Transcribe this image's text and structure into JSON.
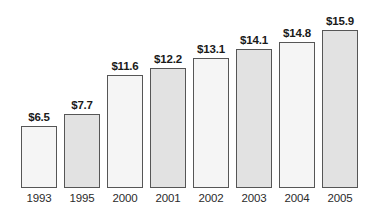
{
  "chart_data": {
    "type": "bar",
    "title": "",
    "subtitle": "",
    "xlabel": "",
    "ylabel": "",
    "grid": false,
    "legend": "none",
    "axis_visible": false,
    "value_prefix": "$",
    "ylim": [
      0,
      15.9
    ],
    "categories": [
      "1993",
      "1995",
      "2000",
      "2001",
      "2002",
      "2003",
      "2004",
      "2005"
    ],
    "values": [
      6.5,
      7.7,
      11.6,
      12.2,
      13.1,
      14.1,
      14.8,
      15.9
    ],
    "value_labels": [
      "$6.5",
      "$7.7",
      "$11.6",
      "$12.2",
      "$13.1",
      "$14.1",
      "$14.8",
      "$15.9"
    ],
    "bars": [
      {
        "category": "1993",
        "value": 6.5,
        "label": "$6.5",
        "shade": "light"
      },
      {
        "category": "1995",
        "value": 7.7,
        "label": "$7.7",
        "shade": "dark"
      },
      {
        "category": "2000",
        "value": 11.6,
        "label": "$11.6",
        "shade": "light"
      },
      {
        "category": "2001",
        "value": 12.2,
        "label": "$12.2",
        "shade": "dark"
      },
      {
        "category": "2002",
        "value": 13.1,
        "label": "$13.1",
        "shade": "light"
      },
      {
        "category": "2003",
        "value": 14.1,
        "label": "$14.1",
        "shade": "dark"
      },
      {
        "category": "2004",
        "value": 14.8,
        "label": "$14.8",
        "shade": "light"
      },
      {
        "category": "2005",
        "value": 15.9,
        "label": "$15.9",
        "shade": "dark"
      }
    ],
    "colors": {
      "bar_fill_light": "#f5f5f5",
      "bar_fill_dark": "#e2e2e2",
      "bar_border": "#565656",
      "value_text": "#1a1a1a",
      "category_text": "#2b2b2b",
      "background": "#ffffff"
    }
  },
  "layout": {
    "baseline_y": 188,
    "bar_width": 36,
    "bar_pitch": 43,
    "first_bar_x": 21,
    "bar_tops": [
      126,
      114,
      75,
      68,
      58,
      49,
      42,
      30
    ]
  }
}
